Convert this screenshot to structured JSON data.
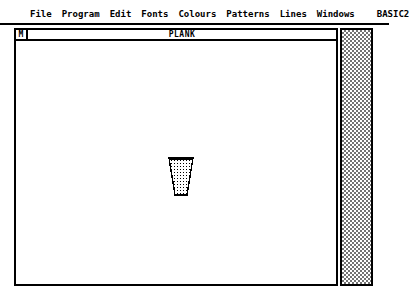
{
  "app": {
    "name": "BASIC2",
    "style": "monochrome-gem-desktop"
  },
  "menubar": {
    "items": [
      {
        "label": "File",
        "name": "menu-file"
      },
      {
        "label": "Program",
        "name": "menu-program"
      },
      {
        "label": "Edit",
        "name": "menu-edit"
      },
      {
        "label": "Fonts",
        "name": "menu-fonts"
      },
      {
        "label": "Colours",
        "name": "menu-colours"
      },
      {
        "label": "Patterns",
        "name": "menu-patterns"
      },
      {
        "label": "Lines",
        "name": "menu-lines"
      },
      {
        "label": "Windows",
        "name": "menu-windows"
      },
      {
        "label": "BASIC2",
        "name": "menu-basic2"
      }
    ]
  },
  "window": {
    "title": "PLANK",
    "menu_button_glyph": "M",
    "canvas": {
      "shape": {
        "kind": "trapezoid",
        "fill": "dotted-pattern",
        "outline_color": "#000000",
        "fill_color": "#ffffff"
      }
    },
    "scrollbar": {
      "orientation": "vertical",
      "pattern": "checkerboard-dither"
    }
  },
  "colors": {
    "foreground": "#000000",
    "background": "#ffffff"
  }
}
